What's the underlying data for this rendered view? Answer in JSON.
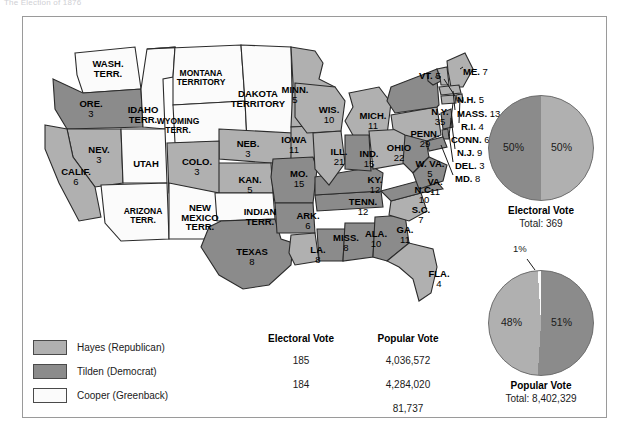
{
  "caption": "The Election of 1876",
  "colors": {
    "hayes": "#b0b0b0",
    "tilden": "#8b8b8b",
    "cooper": "#fbfbfb",
    "border": "#2b2b2b",
    "water": "#ffffff"
  },
  "legend": {
    "items": [
      {
        "label": "Hayes (Republican)",
        "swatch": "hayes"
      },
      {
        "label": "Tilden (Democrat)",
        "swatch": "tilden"
      },
      {
        "label": "Cooper (Greenback)",
        "swatch": "cooper"
      }
    ]
  },
  "table": {
    "headers": [
      "Electoral Vote",
      "Popular Vote"
    ],
    "rows": [
      {
        "electoral": "185",
        "popular": "4,036,572"
      },
      {
        "electoral": "184",
        "popular": "4,284,020"
      },
      {
        "electoral": "",
        "popular": "81,737"
      }
    ]
  },
  "pies": [
    {
      "id": "electoral",
      "title": "Electoral Vote",
      "total_label": "Total: 369",
      "slices": [
        {
          "name": "Hayes",
          "pct": 50,
          "label": "50%",
          "color": "hayes"
        },
        {
          "name": "Tilden",
          "pct": 50,
          "label": "50%",
          "color": "tilden"
        }
      ]
    },
    {
      "id": "popular",
      "title": "Popular Vote",
      "total_label": "Total: 8,402,329",
      "slices": [
        {
          "name": "Tilden",
          "pct": 51,
          "label": "51%",
          "color": "tilden"
        },
        {
          "name": "Hayes",
          "pct": 48,
          "label": "48%",
          "color": "hayes"
        },
        {
          "name": "Cooper",
          "pct": 1,
          "label": "1%",
          "color": "cooper"
        }
      ]
    }
  ],
  "chart_data": {
    "type": "pie",
    "title": "The Election of 1876",
    "charts": [
      {
        "title": "Electoral Vote",
        "total": 369,
        "categories": [
          "Hayes (Republican)",
          "Tilden (Democrat)"
        ],
        "values": [
          185,
          184
        ],
        "percent_labels": [
          "50%",
          "50%"
        ]
      },
      {
        "title": "Popular Vote",
        "total": 8402329,
        "categories": [
          "Hayes (Republican)",
          "Tilden (Democrat)",
          "Cooper (Greenback)"
        ],
        "values": [
          4036572,
          4284020,
          81737
        ],
        "percent_labels": [
          "48%",
          "51%",
          "1%"
        ]
      }
    ],
    "legend": [
      "Hayes (Republican)",
      "Tilden (Democrat)",
      "Cooper (Greenback)"
    ],
    "legend_position": "bottom-left"
  },
  "map": {
    "states": [
      {
        "key": "wash",
        "name": "WASH.",
        "name2": "TERR.",
        "votes": "",
        "party": "cooper",
        "x": 62,
        "y": 42,
        "w": 46
      },
      {
        "key": "ore",
        "name": "ORE.",
        "votes": "3",
        "party": "tilden",
        "x": 48,
        "y": 82,
        "w": 40
      },
      {
        "key": "idaho",
        "name": "IDAHO",
        "name2": "TERR.",
        "votes": "",
        "party": "cooper",
        "x": 98,
        "y": 88,
        "w": 44
      },
      {
        "key": "montana",
        "name": "MONTANA",
        "name2": "TERRITORY",
        "votes": "",
        "party": "cooper",
        "x": 140,
        "y": 52,
        "w": 76
      },
      {
        "key": "wyo",
        "name": "WYOMING",
        "name2": "TERR.",
        "votes": "",
        "party": "cooper",
        "x": 124,
        "y": 100,
        "w": 62
      },
      {
        "key": "dakota",
        "name": "DAKOTA",
        "name2": "TERRITORY",
        "votes": "",
        "party": "cooper",
        "x": 200,
        "y": 72,
        "w": 70
      },
      {
        "key": "minn",
        "name": "MINN.",
        "votes": "5",
        "party": "hayes",
        "x": 252,
        "y": 68,
        "w": 40
      },
      {
        "key": "neb",
        "name": "NEB.",
        "votes": "3",
        "party": "hayes",
        "x": 206,
        "y": 122,
        "w": 38
      },
      {
        "key": "iowa",
        "name": "IOWA",
        "votes": "11",
        "party": "hayes",
        "x": 252,
        "y": 118,
        "w": 38
      },
      {
        "key": "nev",
        "name": "NEV.",
        "votes": "3",
        "party": "hayes",
        "x": 58,
        "y": 128,
        "w": 36
      },
      {
        "key": "utah",
        "name": "UTAH",
        "votes": "",
        "party": "cooper",
        "x": 104,
        "y": 142,
        "w": 38
      },
      {
        "key": "colo",
        "name": "COLO.",
        "votes": "3",
        "party": "hayes",
        "x": 154,
        "y": 140,
        "w": 40
      },
      {
        "key": "kan",
        "name": "KAN.",
        "votes": "5",
        "party": "hayes",
        "x": 208,
        "y": 158,
        "w": 38
      },
      {
        "key": "calif",
        "name": "CALIF.",
        "votes": "6",
        "party": "hayes",
        "x": 32,
        "y": 150,
        "w": 42
      },
      {
        "key": "ariz",
        "name": "ARIZONA",
        "name2": "TERR.",
        "votes": "",
        "party": "cooper",
        "x": 92,
        "y": 190,
        "w": 56
      },
      {
        "key": "nmex",
        "name": "NEW",
        "name2": "MEXICO",
        "name3": "TERR.",
        "votes": "",
        "party": "cooper",
        "x": 150,
        "y": 186,
        "w": 54
      },
      {
        "key": "indian",
        "name": "INDIAN",
        "name2": "TERR.",
        "votes": "",
        "party": "cooper",
        "x": 212,
        "y": 190,
        "w": 50
      },
      {
        "key": "texas",
        "name": "TEXAS",
        "votes": "8",
        "party": "tilden",
        "x": 200,
        "y": 230,
        "w": 58
      },
      {
        "key": "mo",
        "name": "MO.",
        "votes": "15",
        "party": "tilden",
        "x": 258,
        "y": 152,
        "w": 36
      },
      {
        "key": "ark",
        "name": "ARK.",
        "votes": "6",
        "party": "tilden",
        "x": 268,
        "y": 194,
        "w": 34
      },
      {
        "key": "la",
        "name": "LA.",
        "votes": "8",
        "party": "hayes",
        "x": 280,
        "y": 228,
        "w": 30
      },
      {
        "key": "miss",
        "name": "MISS.",
        "votes": "8",
        "party": "tilden",
        "x": 305,
        "y": 216,
        "w": 36
      },
      {
        "key": "ala",
        "name": "ALA.",
        "votes": "10",
        "party": "tilden",
        "x": 336,
        "y": 212,
        "w": 34
      },
      {
        "key": "ga",
        "name": "GA.",
        "votes": "11",
        "party": "tilden",
        "x": 366,
        "y": 208,
        "w": 32
      },
      {
        "key": "fla",
        "name": "FLA.",
        "votes": "4",
        "party": "hayes",
        "x": 400,
        "y": 252,
        "w": 32
      },
      {
        "key": "tenn",
        "name": "TENN.",
        "votes": "12",
        "party": "tilden",
        "x": 318,
        "y": 180,
        "w": 44
      },
      {
        "key": "sc",
        "name": "S.C.",
        "votes": "7",
        "party": "hayes",
        "x": 382,
        "y": 188,
        "w": 32
      },
      {
        "key": "nc",
        "name": "N.C.",
        "votes": "10",
        "party": "tilden",
        "x": 384,
        "y": 168,
        "w": 34
      },
      {
        "key": "ky",
        "name": "KY.",
        "votes": "12",
        "party": "tilden",
        "x": 336,
        "y": 158,
        "w": 32
      },
      {
        "key": "wis",
        "name": "WIS.",
        "votes": "10",
        "party": "hayes",
        "x": 288,
        "y": 88,
        "w": 36
      },
      {
        "key": "ill",
        "name": "ILL.",
        "votes": "21",
        "party": "hayes",
        "x": 300,
        "y": 130,
        "w": 32
      },
      {
        "key": "mich",
        "name": "MICH.",
        "votes": "11",
        "party": "hayes",
        "x": 330,
        "y": 94,
        "w": 40
      },
      {
        "key": "ind",
        "name": "IND.",
        "votes": "15",
        "party": "tilden",
        "x": 330,
        "y": 132,
        "w": 32
      },
      {
        "key": "ohio",
        "name": "OHIO",
        "votes": "22",
        "party": "hayes",
        "x": 358,
        "y": 126,
        "w": 36
      },
      {
        "key": "wva",
        "name": "W. VA.",
        "votes": "5",
        "party": "tilden",
        "x": 388,
        "y": 142,
        "w": 38
      },
      {
        "key": "va",
        "name": "VA.",
        "votes": "11",
        "party": "tilden",
        "x": 396,
        "y": 160,
        "w": 32
      },
      {
        "key": "penn",
        "name": "PENN.",
        "votes": "29",
        "party": "hayes",
        "x": 380,
        "y": 112,
        "w": 44
      },
      {
        "key": "ny",
        "name": "N.Y.",
        "votes": "35",
        "party": "tilden",
        "x": 398,
        "y": 90,
        "w": 38
      }
    ],
    "callouts": [
      {
        "key": "vt",
        "name": "VT.",
        "votes": "5",
        "x": 396,
        "y": 54
      },
      {
        "key": "me",
        "name": "ME.",
        "votes": "7",
        "x": 440,
        "y": 50
      },
      {
        "key": "nh",
        "name": "N.H.",
        "votes": "5",
        "x": 434,
        "y": 78
      },
      {
        "key": "mass",
        "name": "MASS.",
        "votes": "13",
        "x": 434,
        "y": 92
      },
      {
        "key": "ri",
        "name": "R.I.",
        "votes": "4",
        "x": 438,
        "y": 105
      },
      {
        "key": "conn",
        "name": "CONN.",
        "votes": "6",
        "x": 428,
        "y": 118
      },
      {
        "key": "nj",
        "name": "N.J.",
        "votes": "9",
        "x": 434,
        "y": 131
      },
      {
        "key": "del",
        "name": "DEL.",
        "votes": "3",
        "x": 432,
        "y": 144
      },
      {
        "key": "md",
        "name": "MD.",
        "votes": "8",
        "x": 432,
        "y": 157
      }
    ]
  }
}
